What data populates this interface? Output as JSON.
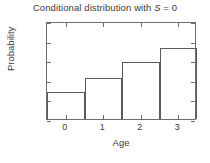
{
  "chart_data": {
    "type": "bar",
    "title": "Conditional distribution with S = 0",
    "title_prefix": "Conditional distribution with ",
    "title_symbol": "S",
    "title_suffix": " = 0",
    "xlabel": "Age",
    "ylabel": "Probability",
    "categories": [
      "0",
      "1",
      "2",
      "3"
    ],
    "values": [
      0.14,
      0.21,
      0.29,
      0.36
    ],
    "ylim": [
      0,
      0.5
    ],
    "xlim": [
      -0.5,
      3.5
    ],
    "yticks": [
      "0",
      "0.1",
      "0.2",
      "0.3",
      "0.4",
      "0.5"
    ],
    "ytick_values": [
      0,
      0.1,
      0.2,
      0.3,
      0.4,
      0.5
    ],
    "xticks": [
      "0",
      "1",
      "2",
      "3"
    ],
    "xtick_values": [
      0,
      1,
      2,
      3
    ],
    "grid": false,
    "legend": null,
    "bar_style": "outline",
    "colors": {
      "background": "#ffffff",
      "axis": "#6e6e6e",
      "bar_edge": "#5a5a5a",
      "bar_fill": "#ffffff",
      "text": "#3a3a3a"
    }
  }
}
